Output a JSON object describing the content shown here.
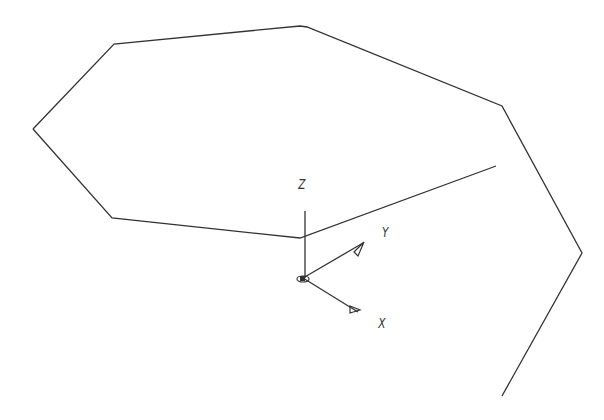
{
  "diagram": {
    "type": "cad-wireframe",
    "colors": {
      "line": "#333333",
      "background": "#ffffff"
    },
    "polyline": [
      [
        33,
        129
      ],
      [
        114,
        44
      ],
      [
        300,
        26
      ],
      [
        307,
        27
      ],
      [
        502,
        106
      ],
      [
        582,
        253
      ],
      [
        502,
        396
      ]
    ],
    "bottom_polyline": [
      [
        33,
        129
      ],
      [
        112,
        218
      ],
      [
        300,
        238
      ],
      [
        496,
        166
      ]
    ],
    "ucs": {
      "origin": [
        303,
        278
      ],
      "z_axis": {
        "from": [
          305,
          278
        ],
        "to": [
          305,
          211
        ],
        "label": "Z",
        "label_pos": [
          297,
          177
        ]
      },
      "y_axis": {
        "to": [
          363,
          243
        ],
        "label": "Y",
        "label_pos": [
          381,
          224
        ]
      },
      "x_axis": {
        "to": [
          358,
          312
        ],
        "label": "X",
        "label_pos": [
          377,
          316
        ]
      }
    }
  }
}
